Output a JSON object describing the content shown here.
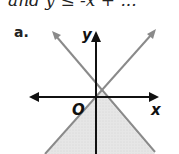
{
  "header": {
    "clipped_text": "and y ≤ -x + ..."
  },
  "figure": {
    "label": "a.",
    "x_axis_label": "x",
    "y_axis_label": "y",
    "origin_label": "O",
    "shading_color": "#e4e4e4",
    "line_color": "#888888",
    "axis_color": "#111111"
  }
}
